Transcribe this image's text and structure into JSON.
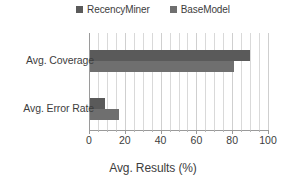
{
  "chart_data": {
    "type": "bar",
    "orientation": "horizontal",
    "title": "",
    "xlabel": "Avg. Results (%)",
    "ylabel": "",
    "categories": [
      "Avg. Coverage",
      "Avg. Error Rate"
    ],
    "series": [
      {
        "name": "RecencyMiner",
        "color": "#5a5a5a",
        "values": [
          90,
          9
        ]
      },
      {
        "name": "BaseModel",
        "color": "#6f6f6f",
        "values": [
          81,
          17
        ]
      }
    ],
    "xlim": [
      0,
      100
    ],
    "xticks": [
      0,
      20,
      40,
      60,
      80,
      100
    ],
    "xtick_labels": [
      "0",
      "20",
      "40",
      "60",
      "80",
      "100"
    ],
    "minor_tick_step": 5,
    "grid": true,
    "grid_axis": "x",
    "legend_position": "top-center"
  },
  "legend": {
    "entries": [
      {
        "label": "RecencyMiner",
        "color": "#5a5a5a"
      },
      {
        "label": "BaseModel",
        "color": "#6f6f6f"
      }
    ]
  },
  "axis": {
    "x_title": "Avg. Results (%)",
    "tick_labels": [
      "0",
      "20",
      "40",
      "60",
      "80",
      "100"
    ],
    "category_labels": [
      "Avg. Coverage",
      "Avg. Error Rate"
    ]
  },
  "colors": {
    "series_recency": "#5a5a5a",
    "series_base": "#6f6f6f",
    "gridline": "#d9d9d9",
    "axis_line": "#9a9a9a",
    "text": "#3d3d3d",
    "background": "#ffffff"
  }
}
